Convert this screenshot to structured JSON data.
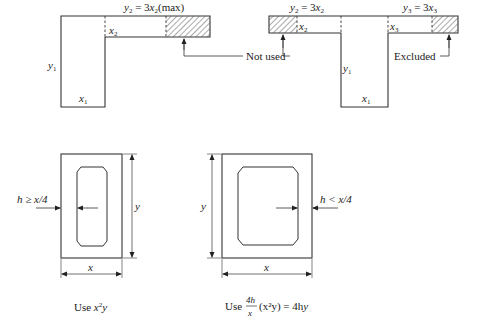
{
  "figure": {
    "top_left": {
      "title_prefix": "y",
      "title_sub": "2",
      "title_mid": " = 3",
      "title_var": "x",
      "title_sub2": "2",
      "title_suffix": "(max)",
      "web_height_label": "y",
      "web_height_sub": "1",
      "web_width_label": "x",
      "web_width_sub": "1",
      "flange_thickness_label": "x",
      "flange_thickness_sub": "2",
      "callout_label": "Not used"
    },
    "top_right": {
      "left_title_prefix": "y",
      "left_title_sub": "2",
      "left_title_mid": " = 3",
      "left_title_var": "x",
      "left_title_sub2": "2",
      "right_title_prefix": "y",
      "right_title_sub": "3",
      "right_title_mid": " = 3",
      "right_title_var": "x",
      "right_title_sub2": "3",
      "left_flange_label": "x",
      "left_flange_sub": "2",
      "right_flange_label": "x",
      "right_flange_sub": "3",
      "web_height_label": "y",
      "web_height_sub": "1",
      "web_width_label": "x",
      "web_width_sub": "1",
      "callout_label": "Excluded"
    },
    "bottom_left": {
      "wall_label": "h ≥ x/4",
      "height_label": "y",
      "width_label": "x",
      "caption_prefix": "Use ",
      "caption_var1": "x",
      "caption_sup": "2",
      "caption_var2": "y"
    },
    "bottom_right": {
      "wall_label": "h < x/4",
      "height_label": "y",
      "width_label": "x",
      "caption_prefix": "Use ",
      "caption_frac_num": "4h",
      "caption_frac_den": "x",
      "caption_paren": "(x²y) = 4h",
      "caption_end": "y"
    }
  }
}
